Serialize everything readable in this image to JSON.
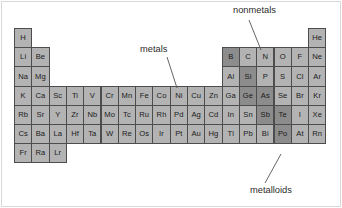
{
  "figure": {
    "background_color": "#ffffff",
    "frame_color": "#d8d8d8"
  },
  "legend_colors": {
    "metal_fill": "#b3b3b3",
    "metalloid_fill": "#8c8c8c",
    "cell_border": "#4d4d4d",
    "text": "#1a1a1a",
    "leader_line": "#555555"
  },
  "annotations": [
    {
      "key": "metals",
      "label": "metals",
      "text_x": 140,
      "text_y": 45,
      "line_x1": 167,
      "line_y1": 57,
      "line_x2": 177,
      "line_y2": 88
    },
    {
      "key": "nonmetals",
      "label": "nonmetals",
      "text_x": 233,
      "text_y": 6,
      "line_x1": 249,
      "line_y1": 20,
      "line_x2": 261,
      "line_y2": 50
    },
    {
      "key": "metalloids",
      "label": "metalloids",
      "text_x": 250,
      "text_y": 186,
      "line_x1": 281,
      "line_y1": 154,
      "line_x2": 265,
      "line_y2": 183
    }
  ],
  "grid": {
    "origin_x": 14,
    "origin_y": 28,
    "cell_width": 17.3,
    "cell_height": 19.2,
    "columns": 18,
    "rows": 7
  },
  "chart_data": {
    "type": "table",
    "categories": [
      "metals",
      "metalloids",
      "nonmetals"
    ],
    "legend": [
      "metals",
      "nonmetals",
      "metalloids"
    ],
    "rows": [
      [
        {
          "symbol": "H",
          "col": 1,
          "class": "metal"
        },
        {
          "symbol": "He",
          "col": 18,
          "class": "metal"
        }
      ],
      [
        {
          "symbol": "Li",
          "col": 1,
          "class": "metal"
        },
        {
          "symbol": "Be",
          "col": 2,
          "class": "metal"
        },
        {
          "symbol": "B",
          "col": 13,
          "class": "metalloid"
        },
        {
          "symbol": "C",
          "col": 14,
          "class": "metal"
        },
        {
          "symbol": "N",
          "col": 15,
          "class": "metal"
        },
        {
          "symbol": "O",
          "col": 16,
          "class": "metal"
        },
        {
          "symbol": "F",
          "col": 17,
          "class": "metal"
        },
        {
          "symbol": "Ne",
          "col": 18,
          "class": "metal"
        }
      ],
      [
        {
          "symbol": "Na",
          "col": 1,
          "class": "metal"
        },
        {
          "symbol": "Mg",
          "col": 2,
          "class": "metal"
        },
        {
          "symbol": "Al",
          "col": 13,
          "class": "metal"
        },
        {
          "symbol": "Si",
          "col": 14,
          "class": "metalloid"
        },
        {
          "symbol": "P",
          "col": 15,
          "class": "metal"
        },
        {
          "symbol": "S",
          "col": 16,
          "class": "metal"
        },
        {
          "symbol": "Cl",
          "col": 17,
          "class": "metal"
        },
        {
          "symbol": "Ar",
          "col": 18,
          "class": "metal"
        }
      ],
      [
        {
          "symbol": "K",
          "col": 1,
          "class": "metal"
        },
        {
          "symbol": "Ca",
          "col": 2,
          "class": "metal"
        },
        {
          "symbol": "Sc",
          "col": 3,
          "class": "metal"
        },
        {
          "symbol": "Ti",
          "col": 4,
          "class": "metal"
        },
        {
          "symbol": "V",
          "col": 5,
          "class": "metal"
        },
        {
          "symbol": "Cr",
          "col": 6,
          "class": "metal"
        },
        {
          "symbol": "Mn",
          "col": 7,
          "class": "metal"
        },
        {
          "symbol": "Fe",
          "col": 8,
          "class": "metal"
        },
        {
          "symbol": "Co",
          "col": 9,
          "class": "metal"
        },
        {
          "symbol": "Ni",
          "col": 10,
          "class": "metal"
        },
        {
          "symbol": "Cu",
          "col": 11,
          "class": "metal"
        },
        {
          "symbol": "Zn",
          "col": 12,
          "class": "metal"
        },
        {
          "symbol": "Ga",
          "col": 13,
          "class": "metal"
        },
        {
          "symbol": "Ge",
          "col": 14,
          "class": "metalloid"
        },
        {
          "symbol": "As",
          "col": 15,
          "class": "metalloid"
        },
        {
          "symbol": "Se",
          "col": 16,
          "class": "metal"
        },
        {
          "symbol": "Br",
          "col": 17,
          "class": "metal"
        },
        {
          "symbol": "Kr",
          "col": 18,
          "class": "metal"
        }
      ],
      [
        {
          "symbol": "Rb",
          "col": 1,
          "class": "metal"
        },
        {
          "symbol": "Sr",
          "col": 2,
          "class": "metal"
        },
        {
          "symbol": "Y",
          "col": 3,
          "class": "metal"
        },
        {
          "symbol": "Zr",
          "col": 4,
          "class": "metal"
        },
        {
          "symbol": "Nb",
          "col": 5,
          "class": "metal"
        },
        {
          "symbol": "Mo",
          "col": 6,
          "class": "metal"
        },
        {
          "symbol": "Tc",
          "col": 7,
          "class": "metal"
        },
        {
          "symbol": "Ru",
          "col": 8,
          "class": "metal"
        },
        {
          "symbol": "Rh",
          "col": 9,
          "class": "metal"
        },
        {
          "symbol": "Pd",
          "col": 10,
          "class": "metal"
        },
        {
          "symbol": "Ag",
          "col": 11,
          "class": "metal"
        },
        {
          "symbol": "Cd",
          "col": 12,
          "class": "metal"
        },
        {
          "symbol": "In",
          "col": 13,
          "class": "metal"
        },
        {
          "symbol": "Sn",
          "col": 14,
          "class": "metal"
        },
        {
          "symbol": "Sb",
          "col": 15,
          "class": "metalloid"
        },
        {
          "symbol": "Te",
          "col": 16,
          "class": "metalloid"
        },
        {
          "symbol": "I",
          "col": 17,
          "class": "metal"
        },
        {
          "symbol": "Xe",
          "col": 18,
          "class": "metal"
        }
      ],
      [
        {
          "symbol": "Cs",
          "col": 1,
          "class": "metal"
        },
        {
          "symbol": "Ba",
          "col": 2,
          "class": "metal"
        },
        {
          "symbol": "La",
          "col": 3,
          "class": "metal"
        },
        {
          "symbol": "Hf",
          "col": 4,
          "class": "metal"
        },
        {
          "symbol": "Ta",
          "col": 5,
          "class": "metal"
        },
        {
          "symbol": "W",
          "col": 6,
          "class": "metal"
        },
        {
          "symbol": "Re",
          "col": 7,
          "class": "metal"
        },
        {
          "symbol": "Os",
          "col": 8,
          "class": "metal"
        },
        {
          "symbol": "Ir",
          "col": 9,
          "class": "metal"
        },
        {
          "symbol": "Pt",
          "col": 10,
          "class": "metal"
        },
        {
          "symbol": "Au",
          "col": 11,
          "class": "metal"
        },
        {
          "symbol": "Hg",
          "col": 12,
          "class": "metal"
        },
        {
          "symbol": "Tl",
          "col": 13,
          "class": "metal"
        },
        {
          "symbol": "Pb",
          "col": 14,
          "class": "metal"
        },
        {
          "symbol": "Bi",
          "col": 15,
          "class": "metal"
        },
        {
          "symbol": "Po",
          "col": 16,
          "class": "metalloid"
        },
        {
          "symbol": "At",
          "col": 17,
          "class": "metal"
        },
        {
          "symbol": "Rn",
          "col": 18,
          "class": "metal"
        }
      ],
      [
        {
          "symbol": "Fr",
          "col": 1,
          "class": "metal"
        },
        {
          "symbol": "Ra",
          "col": 2,
          "class": "metal"
        },
        {
          "symbol": "Lr",
          "col": 3,
          "class": "metal"
        }
      ]
    ]
  }
}
